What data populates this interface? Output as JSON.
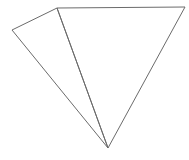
{
  "diagram": {
    "stroke_color": "#6b6b6b",
    "background": "#ffffff",
    "vertices": {
      "A": [
        12,
        30
      ],
      "B": [
        57,
        8
      ],
      "C": [
        185,
        7
      ],
      "D": [
        108,
        148
      ]
    },
    "shapes": [
      {
        "name": "left-triangle",
        "points": "12,30 57,8 108,148"
      },
      {
        "name": "right-triangle",
        "points": "57,8 185,7 108,148"
      }
    ]
  }
}
